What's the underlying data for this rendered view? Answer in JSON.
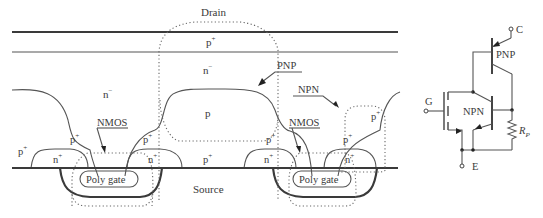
{
  "figure": {
    "cross_section": {
      "terminals": {
        "drain": "Drain",
        "source": "Source"
      },
      "layers": {
        "top_p_plus": "p",
        "top_p_plus_sup": "+",
        "drift_left": "n",
        "drift_left_sup": "−",
        "drift_center": "n",
        "drift_center_sup": "−",
        "p_body_center": "p"
      },
      "left_cell": {
        "p_plus_outer": "p",
        "p_plus_outer_sup": "+",
        "p_plus_inner": "p",
        "p_plus_inner_sup": "+",
        "n_plus_left": "n",
        "n_plus_left_sup": "+",
        "p_plus_right": "p",
        "p_plus_right_sup": "+",
        "n_plus_right": "n",
        "n_plus_right_sup": "+",
        "gate": "Poly gate",
        "nmos_label": "NMOS"
      },
      "middle": {
        "p_plus": "p",
        "p_plus_sup": "+"
      },
      "right_cell": {
        "p_plus_left": "p",
        "p_plus_left_sup": "+",
        "n_plus_left": "n",
        "n_plus_left_sup": "+",
        "p_plus_right": "p",
        "p_plus_right_sup": "+",
        "n_plus_right": "n",
        "n_plus_right_sup": "+",
        "p_plus_outer": "p",
        "p_plus_outer_sup": "+",
        "gate": "Poly gate",
        "nmos_label": "NMOS"
      },
      "annotations": {
        "pnp": "PNP",
        "npn": "NPN"
      }
    },
    "equivalent_circuit": {
      "collector": "C",
      "gate": "G",
      "emitter": "E",
      "pnp": "PNP",
      "npn": "NPN",
      "resistor": "R",
      "resistor_sub": "P"
    }
  }
}
